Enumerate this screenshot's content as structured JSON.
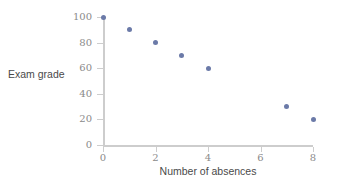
{
  "chart_data": {
    "type": "scatter",
    "title": "",
    "xlabel": "Number of absences",
    "ylabel": "Exam grade",
    "x": [
      0,
      1,
      2,
      3,
      4,
      7,
      8
    ],
    "values": [
      100,
      90,
      80,
      70,
      60,
      30,
      20
    ],
    "points": [
      {
        "x": 0,
        "y": 100
      },
      {
        "x": 1,
        "y": 90
      },
      {
        "x": 2,
        "y": 80
      },
      {
        "x": 3,
        "y": 70
      },
      {
        "x": 4,
        "y": 60
      },
      {
        "x": 7,
        "y": 30
      },
      {
        "x": 8,
        "y": 20
      }
    ],
    "xlim": [
      0,
      8
    ],
    "ylim": [
      0,
      100
    ],
    "xticks": [
      0,
      2,
      4,
      6,
      8
    ],
    "yticks": [
      0,
      20,
      40,
      60,
      80,
      100
    ],
    "xtick_labels": [
      "0",
      "2",
      "4",
      "6",
      "8"
    ],
    "ytick_labels": [
      "0",
      "20",
      "40",
      "60",
      "80",
      "100"
    ],
    "grid": false,
    "legend": null,
    "legend_position": "none",
    "marker_color": "#6b7aa8",
    "axis_color": "#cdcdcd",
    "tick_label_color": "#8a8a8a",
    "axis_title_color": "#4a4a4a",
    "background_color": "#ffffff"
  }
}
